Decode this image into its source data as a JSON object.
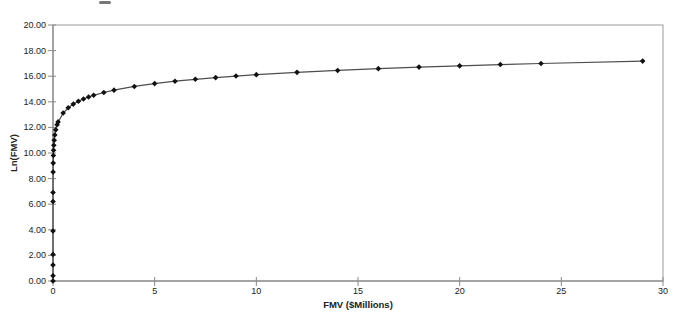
{
  "page": {
    "background": "#ffffff",
    "top_edge_artifact": "cut-off-text-fragment"
  },
  "chart_data": {
    "type": "line",
    "title": "",
    "xlabel": "FMV ($Millions)",
    "ylabel": "Ln(FMV)",
    "xlim": [
      0,
      30
    ],
    "ylim": [
      0,
      20
    ],
    "grid": false,
    "legend": "none",
    "marker": "diamond",
    "x_tick_values": [
      0,
      5,
      10,
      15,
      20,
      25,
      30
    ],
    "x_tick_labels": [
      "0",
      "5",
      "10",
      "15",
      "20",
      "25",
      "30"
    ],
    "y_tick_values": [
      0,
      2,
      4,
      6,
      8,
      10,
      12,
      14,
      16,
      18,
      20
    ],
    "y_tick_labels": [
      "0.00",
      "2.00",
      "4.00",
      "6.00",
      "8.00",
      "10.00",
      "12.00",
      "14.00",
      "16.00",
      "18.00",
      "20.00"
    ],
    "colors": {
      "line": "#4d4d4d",
      "marker": "#111111",
      "frame": "#9a9a9a",
      "axis": "#7d7d7d",
      "tick": "#8a8a8a",
      "text": "#222222"
    },
    "series": [
      {
        "name": "Ln(FMV)",
        "points": [
          [
            1e-06,
            0.0
          ],
          [
            1.5e-06,
            0.41
          ],
          [
            3.5e-06,
            1.25
          ],
          [
            8e-06,
            2.08
          ],
          [
            5e-05,
            3.91
          ],
          [
            0.0005,
            6.21
          ],
          [
            0.001,
            6.91
          ],
          [
            0.005,
            8.52
          ],
          [
            0.01,
            9.21
          ],
          [
            0.018,
            9.8
          ],
          [
            0.027,
            10.21
          ],
          [
            0.04,
            10.6
          ],
          [
            0.06,
            11.0
          ],
          [
            0.09,
            11.41
          ],
          [
            0.135,
            11.81
          ],
          [
            0.2,
            12.21
          ],
          [
            0.25,
            12.43
          ],
          [
            0.5,
            13.12
          ],
          [
            0.75,
            13.53
          ],
          [
            1,
            13.82
          ],
          [
            1.25,
            14.04
          ],
          [
            1.5,
            14.22
          ],
          [
            1.75,
            14.38
          ],
          [
            2,
            14.51
          ],
          [
            2.5,
            14.73
          ],
          [
            3,
            14.91
          ],
          [
            4,
            15.2
          ],
          [
            5,
            15.42
          ],
          [
            6,
            15.61
          ],
          [
            7,
            15.76
          ],
          [
            8,
            15.89
          ],
          [
            9,
            16.01
          ],
          [
            10,
            16.12
          ],
          [
            12,
            16.3
          ],
          [
            14,
            16.45
          ],
          [
            16,
            16.59
          ],
          [
            18,
            16.71
          ],
          [
            20,
            16.81
          ],
          [
            22,
            16.91
          ],
          [
            24,
            16.99
          ],
          [
            29,
            17.18
          ]
        ]
      }
    ],
    "plot_area_px": {
      "left": 53,
      "top": 25,
      "right": 663,
      "bottom": 281
    }
  }
}
